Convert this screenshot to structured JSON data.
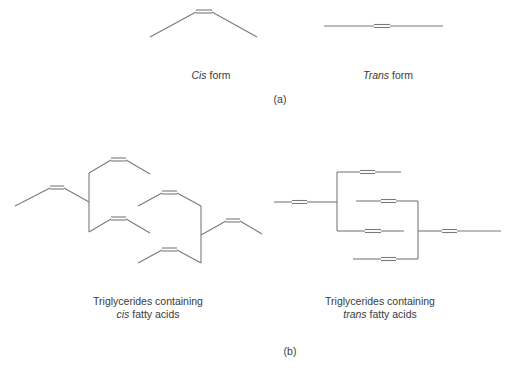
{
  "panel_a": {
    "cis_label": {
      "italic": "Cis",
      "rest": " form"
    },
    "trans_label": {
      "italic": "Trans",
      "rest": " form"
    },
    "caption": "(a)"
  },
  "panel_b": {
    "cis_label": {
      "line1": "Triglycerides containing",
      "italic": "cis",
      "rest": " fatty acids"
    },
    "trans_label": {
      "line1": "Triglycerides containing",
      "italic": "trans",
      "rest": " fatty acids"
    },
    "caption": "(b)"
  },
  "colors": {
    "stroke": "#7a7a7a",
    "text": "#3a3a3a",
    "background": "#ffffff"
  }
}
